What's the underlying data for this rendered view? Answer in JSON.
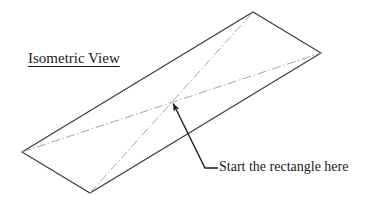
{
  "drawing": {
    "title": "Isometric View",
    "callout_label": "Start the rectangle here",
    "colors": {
      "outline": "#3d3d3d",
      "centerline": "#9a9a9a",
      "leader": "#1a1a1a",
      "text": "#1a1a1a",
      "background": "#ffffff"
    },
    "shape": {
      "type": "parallelogram",
      "name": "isometric-rectangle",
      "vertices": {
        "top": [
          253,
          12
        ],
        "right": [
          321,
          53
        ],
        "bottom": [
          90,
          193
        ],
        "left": [
          22,
          152
        ]
      },
      "vertex_order": [
        "left",
        "top",
        "right",
        "bottom"
      ]
    },
    "centerlines": [
      {
        "name": "diagonal-left-right",
        "from": [
          22,
          152
        ],
        "to": [
          321,
          53
        ],
        "style": "dash-dot"
      },
      {
        "name": "diagonal-bottom-top",
        "from": [
          90,
          193
        ],
        "to": [
          253,
          12
        ],
        "style": "dash-dot"
      }
    ],
    "center_point": [
      172,
      100
    ],
    "leader": {
      "name": "callout-arrow",
      "arrow_tip": [
        172,
        101
      ],
      "elbow": [
        205,
        168
      ],
      "tail_end": [
        218,
        168
      ],
      "has_arrowhead": true
    }
  }
}
